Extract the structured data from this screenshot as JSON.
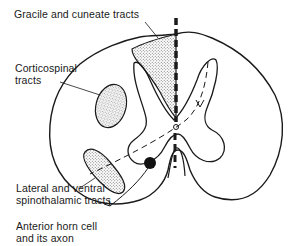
{
  "diagram": {
    "labels": {
      "gracile_cuneate": "Gracile and cuneate tracts",
      "corticospinal_line1": "Corticospinal",
      "corticospinal_line2": "tracts",
      "spinothalamic_line1": "Lateral and ventral",
      "spinothalamic_line2": "spinothalamic tracts",
      "anterior_horn_line1": "Anterior horn cell",
      "anterior_horn_line2": "and its axon"
    },
    "colors": {
      "ink": "#1a1a1a",
      "stipple": "#9a9a9a",
      "background": "#ffffff"
    }
  }
}
